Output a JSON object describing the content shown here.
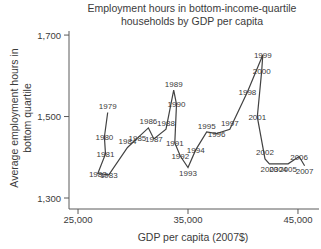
{
  "chart_data": {
    "type": "line",
    "title": "Employment hours in bottom-income-quartile households by GDP per capita",
    "title_lines": [
      "Employment hours in bottom-income-quartile",
      "households by GDP per capita"
    ],
    "xlabel": "GDP per capita (2007$)",
    "ylabel": "Average employment hours in bottom quartile",
    "ylabel_lines": [
      "Average employment hours in",
      "bottom quartile"
    ],
    "x_ticks": [
      {
        "value": 25000,
        "label": "25,000"
      },
      {
        "value": 35000,
        "label": "35,000"
      },
      {
        "value": 45000,
        "label": "45,000"
      }
    ],
    "y_ticks": [
      {
        "value": 1300,
        "label": "1,300"
      },
      {
        "value": 1500,
        "label": "1,500"
      },
      {
        "value": 1700,
        "label": "1,700"
      }
    ],
    "xlim": [
      24180,
      46820
    ],
    "ylim": [
      1273,
      1710
    ],
    "grid": false,
    "legend": "none",
    "line_color": "#424242",
    "axis_color": "#5a5a5a",
    "text_color": "#3b3b3b",
    "points": [
      {
        "year": "1979",
        "gdp": 27700,
        "hours": 1510,
        "label_pos": "above"
      },
      {
        "year": "1980",
        "gdp": 27400,
        "hours": 1450,
        "label_pos": "center"
      },
      {
        "year": "1981",
        "gdp": 27500,
        "hours": 1408,
        "label_pos": "center"
      },
      {
        "year": "1982",
        "gdp": 26800,
        "hours": 1360,
        "label_pos": "center"
      },
      {
        "year": "1983",
        "gdp": 27800,
        "hours": 1357,
        "label_pos": "center"
      },
      {
        "year": "1984",
        "gdp": 29500,
        "hours": 1424,
        "label_pos": "above"
      },
      {
        "year": "1985",
        "gdp": 30400,
        "hours": 1447,
        "label_pos": "center"
      },
      {
        "year": "1986",
        "gdp": 31400,
        "hours": 1472,
        "label_pos": "above"
      },
      {
        "year": "1987",
        "gdp": 31900,
        "hours": 1445,
        "label_pos": "center"
      },
      {
        "year": "1988",
        "gdp": 33000,
        "hours": 1469,
        "label_pos": "above"
      },
      {
        "year": "1989",
        "gdp": 33700,
        "hours": 1565,
        "label_pos": "above"
      },
      {
        "year": "1990",
        "gdp": 33950,
        "hours": 1530,
        "label_pos": "center"
      },
      {
        "year": "1991",
        "gdp": 33800,
        "hours": 1435,
        "label_pos": "center"
      },
      {
        "year": "1992",
        "gdp": 34300,
        "hours": 1403,
        "label_pos": "center"
      },
      {
        "year": "1993",
        "gdp": 35000,
        "hours": 1375,
        "label_pos": "below"
      },
      {
        "year": "1994",
        "gdp": 35700,
        "hours": 1418,
        "label_pos": "center"
      },
      {
        "year": "1995",
        "gdp": 36700,
        "hours": 1462,
        "label_pos": "above"
      },
      {
        "year": "1996",
        "gdp": 37600,
        "hours": 1458,
        "label_pos": "center"
      },
      {
        "year": "1997",
        "gdp": 38800,
        "hours": 1469,
        "label_pos": "above"
      },
      {
        "year": "1998",
        "gdp": 40400,
        "hours": 1560,
        "label_pos": "center"
      },
      {
        "year": "1999",
        "gdp": 41800,
        "hours": 1651,
        "label_pos": "center"
      },
      {
        "year": "2000",
        "gdp": 41700,
        "hours": 1612,
        "label_pos": "center"
      },
      {
        "year": "2001",
        "gdp": 41300,
        "hours": 1499,
        "label_pos": "center"
      },
      {
        "year": "2002",
        "gdp": 42000,
        "hours": 1396,
        "label_pos": "above"
      },
      {
        "year": "2003",
        "gdp": 42400,
        "hours": 1384,
        "label_pos": "below"
      },
      {
        "year": "2004",
        "gdp": 43200,
        "hours": 1384,
        "label_pos": "below"
      },
      {
        "year": "2005",
        "gdp": 44100,
        "hours": 1384,
        "label_pos": "below"
      },
      {
        "year": "2006",
        "gdp": 45100,
        "hours": 1402,
        "label_pos": "center"
      },
      {
        "year": "2007",
        "gdp": 45600,
        "hours": 1379,
        "label_pos": "below"
      }
    ]
  }
}
